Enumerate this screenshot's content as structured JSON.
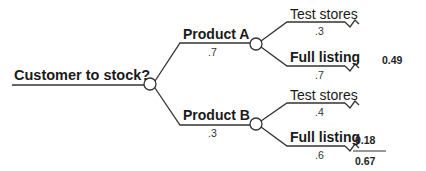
{
  "diagram": {
    "type": "decision-tree",
    "root": {
      "label": "Customer to stock?"
    },
    "branches": [
      {
        "label": "Product A",
        "probability": ".7",
        "children": [
          {
            "label": "Test stores",
            "probability": ".3",
            "bold": false,
            "value": null
          },
          {
            "label": "Full listing",
            "probability": ".7",
            "bold": true,
            "value": "0.49"
          }
        ]
      },
      {
        "label": "Product B",
        "probability": ".3",
        "children": [
          {
            "label": "Test stores",
            "probability": ".4",
            "bold": false,
            "value": null
          },
          {
            "label": "Full listing",
            "probability": ".6",
            "bold": true,
            "value": "0.18"
          }
        ]
      }
    ],
    "total": "0.67",
    "colors": {
      "line": "#333333",
      "background": "#ffffff",
      "text": "#1a1a1a"
    }
  }
}
